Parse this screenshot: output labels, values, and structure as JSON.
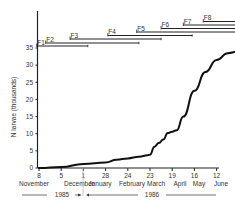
{
  "chart_data": {
    "type": "line",
    "title": "",
    "xlabel": "",
    "ylabel": "N larvae (thousands)",
    "ylim": [
      0,
      35
    ],
    "yticks": [
      0,
      5,
      10,
      15,
      20,
      25,
      30,
      35
    ],
    "x_ticks": [
      {
        "day": "8",
        "month": "November"
      },
      {
        "day": "5",
        "month": "December"
      },
      {
        "day": "1",
        "month": "January"
      },
      {
        "day": "28",
        "month": "January"
      },
      {
        "day": "24",
        "month": "February"
      },
      {
        "day": "23",
        "month": "March"
      },
      {
        "day": "19",
        "month": "April"
      },
      {
        "day": "16",
        "month": "May"
      },
      {
        "day": "12",
        "month": "June"
      }
    ],
    "month_labels": [
      "November",
      "December",
      "January",
      "February",
      "March",
      "April",
      "May",
      "June"
    ],
    "year_labels": [
      "1985",
      "1986"
    ],
    "grid": false,
    "series": [
      {
        "name": "N larvae",
        "x_index": [
          0,
          1,
          2,
          3,
          3.5,
          4,
          4.5,
          4.9,
          5,
          5.2,
          5.4,
          5.6,
          5.8,
          6,
          6.2,
          6.5,
          7,
          7.5,
          8,
          8.5,
          9
        ],
        "values": [
          0,
          0.3,
          1.2,
          1.6,
          2.4,
          2.8,
          3.3,
          3.7,
          3.9,
          6.2,
          7.3,
          8.3,
          10.2,
          10.6,
          11.0,
          15.0,
          22.5,
          28.0,
          31.5,
          33.5,
          34.0
        ]
      }
    ],
    "periods": [
      {
        "label": "F1",
        "start_index": -0.1,
        "end_index": 2.2
      },
      {
        "label": "F2",
        "start_index": 0.3,
        "end_index": 4.5
      },
      {
        "label": "F3",
        "start_index": 1.4,
        "end_index": 5.5
      },
      {
        "label": "F4",
        "start_index": 3.1,
        "end_index": 6.9
      },
      {
        "label": "F5",
        "start_index": 4.4,
        "end_index": 9.1
      },
      {
        "label": "F6",
        "start_index": 5.5,
        "end_index": 9.1
      },
      {
        "label": "F7",
        "start_index": 6.5,
        "end_index": 9.1
      },
      {
        "label": "F8",
        "start_index": 7.4,
        "end_index": 9.1
      }
    ]
  },
  "axes": {
    "ylabel": "N larvae (thousands)",
    "yticks": [
      "0",
      "5",
      "10",
      "15",
      "20",
      "25",
      "30",
      "35"
    ],
    "xdays": [
      "8",
      "5",
      "1",
      "28",
      "24",
      "23",
      "19",
      "16",
      "12"
    ],
    "xmonths": [
      "November",
      "December",
      "January",
      "February",
      "March",
      "April",
      "May",
      "June"
    ]
  },
  "years": {
    "left": "1985",
    "right": "1986"
  }
}
